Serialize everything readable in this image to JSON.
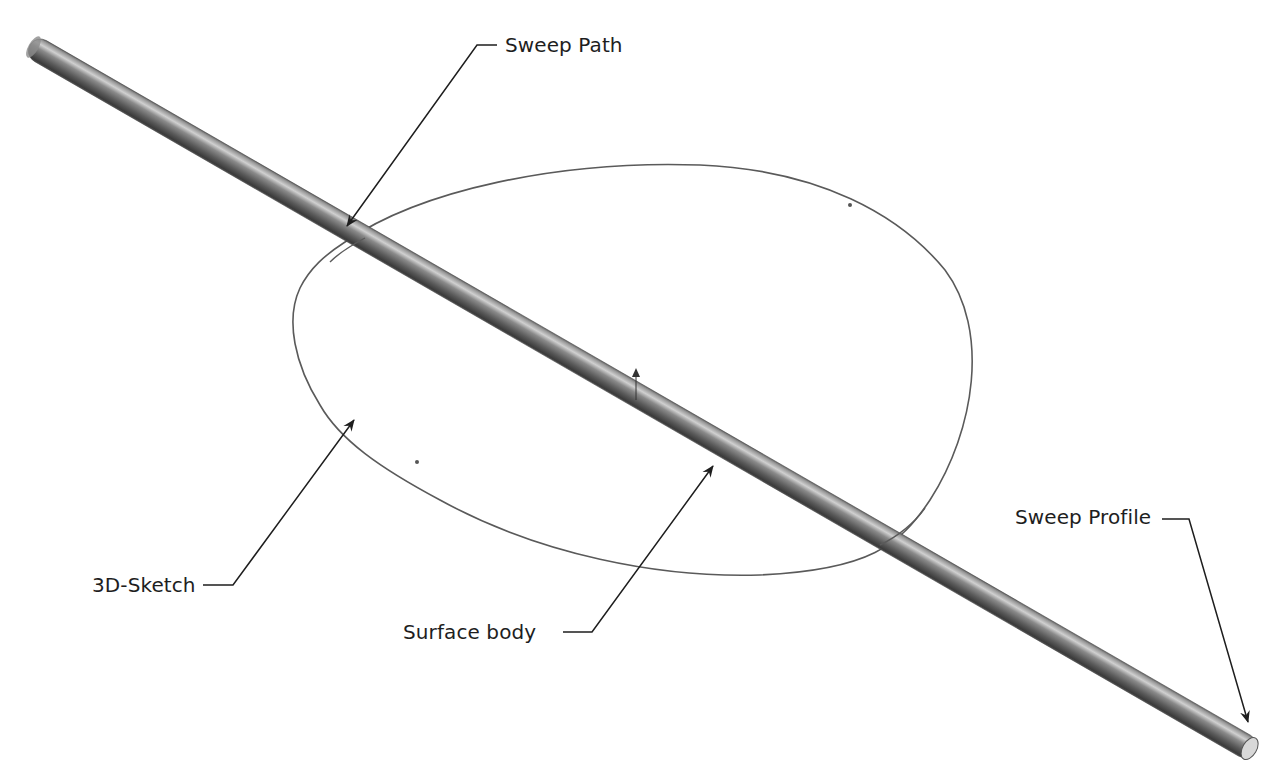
{
  "figure": {
    "colors": {
      "background": "#ffffff",
      "rod_dark": "#3c3c3c",
      "rod_mid": "#7a7a7a",
      "rod_light": "#c8c8c8",
      "sketch_curve": "#555555",
      "leader_line": "#1e1e1e",
      "label_text": "#1e1e1e"
    }
  },
  "callouts": {
    "sweep_path": {
      "label": "Sweep Path"
    },
    "sketch_3d": {
      "label": "3D-Sketch"
    },
    "surface_body": {
      "label": "Surface body"
    },
    "sweep_profile": {
      "label": "Sweep Profile"
    }
  }
}
